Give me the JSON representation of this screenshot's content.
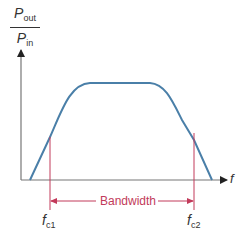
{
  "diagram": {
    "y_axis": {
      "numerator": "P",
      "numerator_sub": "out",
      "denominator": "P",
      "denominator_sub": "in"
    },
    "x_axis": {
      "label": "f"
    },
    "cutoffs": [
      {
        "label": "f",
        "sub": "c1"
      },
      {
        "label": "f",
        "sub": "c2"
      }
    ],
    "bandwidth_label": "Bandwidth",
    "colors": {
      "curve": "#4a7fa8",
      "axes": "#555555",
      "cutoff_lines": "#c23a5a",
      "text": "#333333"
    }
  }
}
